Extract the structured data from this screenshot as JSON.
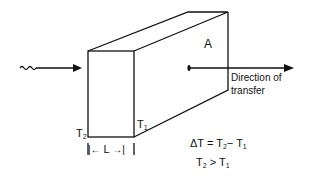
{
  "diagram": {
    "type": "heat-conduction-slab",
    "labels": {
      "area": "A",
      "direction_line1": "Direction of",
      "direction_line2": "transfer",
      "t2_base": "T",
      "t2_sub": "2",
      "t1_base": "T",
      "t1_sub": "1",
      "length": "L",
      "length_left_arrow": "|←",
      "length_right_arrow": "→|",
      "delta_eq_prefix": "ΔT = T",
      "delta_eq_sub1": "2",
      "delta_eq_mid": "− T",
      "delta_eq_sub2": "1",
      "ineq_base1": "T",
      "ineq_sub1": "2",
      "ineq_mid": " > T",
      "ineq_sub2": "1"
    },
    "colors": {
      "stroke": "#111111",
      "background": "#ffffff"
    }
  }
}
